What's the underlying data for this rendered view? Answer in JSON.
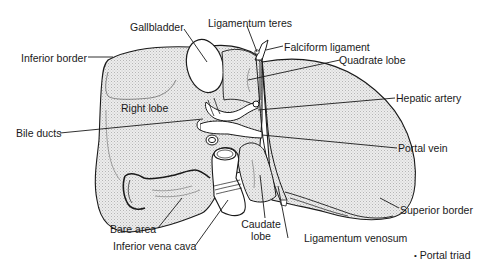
{
  "figure": {
    "colors": {
      "outline": "#1a1a1a",
      "fill": "#e4e4e4",
      "stipple": "#bdbdbd",
      "background": "#ffffff",
      "vessel_fill": "#ffffff"
    },
    "labels": {
      "gallbladder": "Gallbladder",
      "ligamentum_teres": "Ligamentum teres",
      "falciform_ligament": "Falciform ligament",
      "inferior_border": "Inferior border",
      "quadrate_lobe": "Quadrate lobe",
      "right_lobe": "Right lobe",
      "hepatic_artery": "Hepatic artery",
      "bile_ducts": "Bile ducts",
      "portal_vein": "Portal vein",
      "superior_border": "Superior border",
      "bare_area": "Bare area",
      "inferior_vena_cava": "Inferior vena cava",
      "caudate_lobe_line1": "Caudate",
      "caudate_lobe_line2": "lobe",
      "ligamentum_venosum": "Ligamentum venosum"
    },
    "footnote": {
      "marker": "•",
      "text": "Portal triad"
    }
  }
}
